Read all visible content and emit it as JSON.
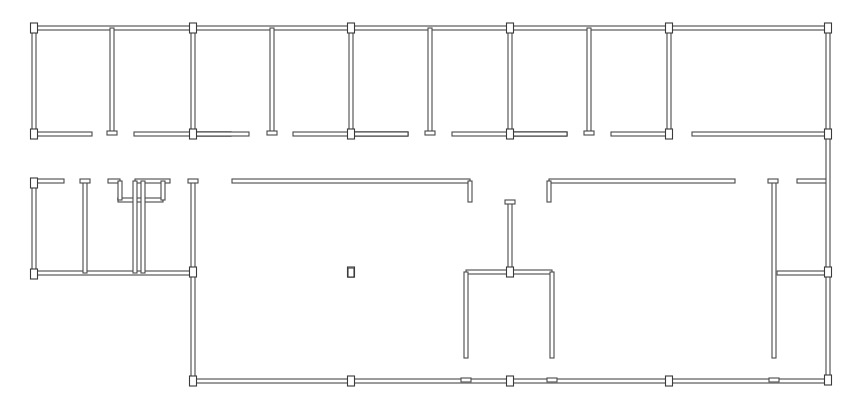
{
  "diagram": {
    "type": "architectural-floor-plan",
    "colors": {
      "background": "#ffffff",
      "wall_stroke": "#4a4a4a",
      "column_stroke": "#3a3a3a"
    },
    "wall_thickness": 4,
    "columns": [
      [
        34,
        28
      ],
      [
        193,
        28
      ],
      [
        351,
        28
      ],
      [
        510,
        28
      ],
      [
        669,
        28
      ],
      [
        828,
        28
      ],
      [
        34,
        134
      ],
      [
        193,
        134
      ],
      [
        351,
        134
      ],
      [
        510,
        134
      ],
      [
        669,
        134
      ],
      [
        828,
        134
      ],
      [
        34,
        183
      ],
      [
        34,
        274
      ],
      [
        193,
        272
      ],
      [
        351,
        272
      ],
      [
        510,
        272
      ],
      [
        828,
        272
      ],
      [
        193,
        381
      ],
      [
        351,
        381
      ],
      [
        510,
        381
      ],
      [
        669,
        381
      ],
      [
        828,
        380
      ]
    ],
    "walls_h": [
      [
        34,
        28,
        828
      ],
      [
        34,
        134,
        92
      ],
      [
        134,
        134,
        231
      ],
      [
        193,
        134,
        249
      ],
      [
        293,
        134,
        408
      ],
      [
        351,
        134,
        408
      ],
      [
        452,
        134,
        567
      ],
      [
        510,
        134,
        567
      ],
      [
        611,
        134,
        669
      ],
      [
        692,
        134,
        828
      ],
      [
        34,
        181,
        64
      ],
      [
        108,
        181,
        120
      ],
      [
        135,
        181,
        170
      ],
      [
        232,
        181,
        470
      ],
      [
        549,
        181,
        735
      ],
      [
        797,
        181,
        828
      ],
      [
        34,
        273,
        193
      ],
      [
        777,
        273,
        828
      ],
      [
        466,
        272,
        552
      ],
      [
        193,
        381,
        828
      ],
      [
        118,
        200,
        163
      ]
    ],
    "walls_v": [
      [
        34,
        28,
        134
      ],
      [
        112,
        28,
        134
      ],
      [
        193,
        28,
        134
      ],
      [
        272,
        28,
        134
      ],
      [
        351,
        28,
        134
      ],
      [
        430,
        28,
        134
      ],
      [
        510,
        28,
        134
      ],
      [
        589,
        28,
        134
      ],
      [
        669,
        28,
        134
      ],
      [
        828,
        28,
        380
      ],
      [
        34,
        181,
        274
      ],
      [
        85,
        181,
        273
      ],
      [
        193,
        181,
        381
      ],
      [
        120,
        181,
        200
      ],
      [
        163,
        181,
        200
      ],
      [
        135,
        181,
        273
      ],
      [
        143,
        181,
        273
      ],
      [
        470,
        181,
        202
      ],
      [
        549,
        181,
        202
      ],
      [
        510,
        202,
        272
      ],
      [
        466,
        272,
        358
      ],
      [
        552,
        272,
        358
      ],
      [
        774,
        181,
        358
      ]
    ],
    "door_stubs": [
      [
        112,
        133
      ],
      [
        272,
        133
      ],
      [
        430,
        133
      ],
      [
        589,
        133
      ],
      [
        85,
        181
      ],
      [
        193,
        181
      ],
      [
        510,
        202
      ],
      [
        773,
        181
      ],
      [
        466,
        380
      ],
      [
        552,
        380
      ],
      [
        774,
        380
      ]
    ],
    "free_column": [
      348,
      268,
      6,
      9
    ]
  }
}
